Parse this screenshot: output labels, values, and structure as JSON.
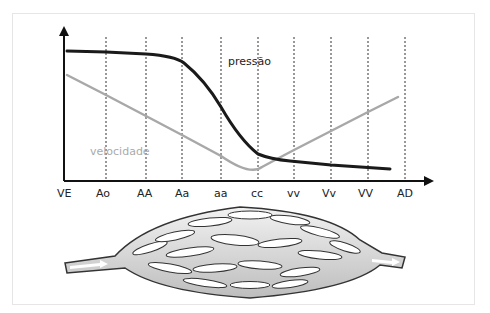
{
  "diagram": {
    "x_axis_labels": [
      "VE",
      "Ao",
      "AA",
      "Aa",
      "aa",
      "cc",
      "vv",
      "Vv",
      "VV",
      "AD"
    ],
    "curves": {
      "pressure": {
        "label": "pressão",
        "color": "#1a1a1a"
      },
      "velocity": {
        "label": "velocidade",
        "color": "#a8a8a8"
      }
    },
    "bottom_illustration": "vascular-network"
  }
}
